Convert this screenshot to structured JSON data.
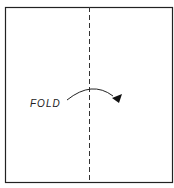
{
  "diagram": {
    "label": "FOLD",
    "colors": {
      "line": "#222222",
      "background": "#ffffff"
    }
  }
}
